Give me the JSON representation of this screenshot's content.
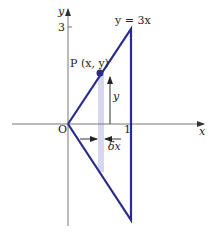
{
  "diagram": {
    "axes": {
      "x_label": "x",
      "y_label": "y",
      "origin_label": "O",
      "x_tick_label": "1",
      "y_tick_label": "3"
    },
    "curve_label": "y = 3x",
    "point_label": "P (x, y)",
    "height_label": "y",
    "width_label": "δx",
    "colors": {
      "triangle": "#2b2b8c",
      "strip": "#d6d6ef",
      "axes": "#777777",
      "point": "#2b2b8c"
    }
  }
}
